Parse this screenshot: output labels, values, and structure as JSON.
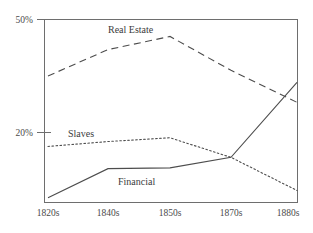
{
  "chart_data": {
    "type": "line",
    "title": "",
    "subtitle": "",
    "xlabel": "",
    "ylabel": "",
    "categories": [
      "1820s",
      "1840s",
      "1850s",
      "1870s",
      "1880s"
    ],
    "x_tick_labels": [
      "1820s",
      "1840s",
      "1850s",
      "1870s",
      "1880s"
    ],
    "y_tick_labels": [
      "50%",
      "20%"
    ],
    "y_tick_values": [
      50,
      20
    ],
    "ylim": [
      0,
      52
    ],
    "xlim": [
      0,
      4
    ],
    "grid": false,
    "legend_position": "inline-annotations",
    "series": [
      {
        "name": "Real Estate",
        "style": "dashed",
        "color": "#4d4d4d",
        "values": [
          35.0,
          42.0,
          45.5,
          36.5,
          28.0
        ]
      },
      {
        "name": "Slaves",
        "style": "dotted",
        "color": "#4d4d4d",
        "values": [
          16.3,
          17.6,
          18.6,
          13.4,
          4.6
        ]
      },
      {
        "name": "Financial",
        "style": "solid",
        "color": "#4d4d4d",
        "values": [
          2.7,
          10.4,
          10.6,
          13.4,
          33.3
        ]
      }
    ],
    "annotations": [
      {
        "text": "Real Estate",
        "series": "Real Estate",
        "x": 108,
        "y": 33
      },
      {
        "text": "Slaves",
        "series": "Slaves",
        "x": 68,
        "y": 137
      },
      {
        "text": "Financial",
        "series": "Financial",
        "x": 118,
        "y": 185
      }
    ],
    "frame": {
      "left": 44,
      "right": 298,
      "top": 19,
      "bottom": 203
    },
    "axis_color": "#6e6e6e",
    "background_color": "#ffffff"
  }
}
